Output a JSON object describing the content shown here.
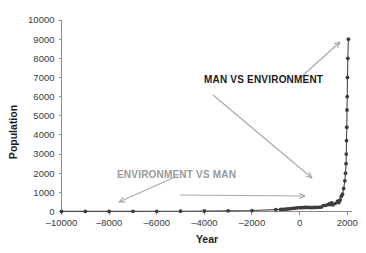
{
  "chart_data": {
    "type": "line",
    "title": "",
    "xlabel": "Year",
    "ylabel": "Population",
    "xlim": [
      -10000,
      2200
    ],
    "ylim": [
      0,
      10000
    ],
    "grid": false,
    "legend": "none",
    "markers": "filled-circle",
    "x_ticks": [
      -10000,
      -8000,
      -6000,
      -4000,
      -2000,
      0,
      2000
    ],
    "x_tick_labels": [
      "–10000",
      "–8000",
      "–6000",
      "–4000",
      "–2000",
      "0",
      "2000"
    ],
    "y_ticks": [
      0,
      1000,
      2000,
      3000,
      4000,
      5000,
      6000,
      7000,
      8000,
      9000,
      10000
    ],
    "y_tick_labels": [
      "0",
      "1000",
      "2000",
      "3000",
      "4000",
      "5000",
      "6000",
      "7000",
      "8000",
      "9000",
      "10000"
    ],
    "series": [
      {
        "name": "World Population",
        "x": [
          -10000,
          -9000,
          -8000,
          -7000,
          -6000,
          -5000,
          -4000,
          -3000,
          -2000,
          -1000,
          -800,
          -700,
          -600,
          -500,
          -400,
          -300,
          -200,
          -100,
          0,
          100,
          200,
          300,
          400,
          500,
          600,
          700,
          800,
          900,
          1000,
          1100,
          1200,
          1250,
          1300,
          1340,
          1400,
          1500,
          1600,
          1650,
          1700,
          1750,
          1800,
          1850,
          1900,
          1927,
          1950,
          1960,
          1970,
          1980,
          1990,
          1999,
          2011,
          2025,
          2050
        ],
        "y": [
          4,
          5,
          5,
          7,
          10,
          15,
          25,
          35,
          50,
          100,
          110,
          115,
          120,
          130,
          145,
          160,
          175,
          190,
          200,
          202,
          210,
          215,
          210,
          205,
          208,
          215,
          220,
          226,
          310,
          320,
          360,
          400,
          360,
          443,
          350,
          425,
          545,
          470,
          600,
          790,
          900,
          1200,
          1600,
          2000,
          2500,
          3000,
          3700,
          4400,
          5300,
          6000,
          7000,
          8000,
          9000
        ],
        "units": "millions"
      }
    ],
    "annotations": [
      {
        "id": "man-vs-environment",
        "text": "MAN VS ENVIRONMENT",
        "color": "#1b1b1b",
        "style": "bold",
        "x": 204,
        "y": 83
      },
      {
        "id": "environment-vs-man",
        "text": "ENVIRONMENT VS MAN",
        "color": "#9a9a9a",
        "style": "bold",
        "x": 117,
        "y": 178
      }
    ],
    "arrows": [
      {
        "id": "arrow-up-right",
        "from": [
          300,
          78
        ],
        "to": [
          340,
          42
        ],
        "color": "#a6a6a6"
      },
      {
        "id": "arrow-down-right",
        "from": [
          213,
          95
        ],
        "to": [
          312,
          178
        ],
        "color": "#a6a6a6"
      },
      {
        "id": "arrow-left-down",
        "from": [
          175,
          177
        ],
        "to": [
          119,
          202
        ],
        "color": "#a6a6a6"
      },
      {
        "id": "arrow-right-flat",
        "from": [
          180,
          195
        ],
        "to": [
          305,
          196
        ],
        "color": "#a6a6a6"
      }
    ],
    "colors": {
      "marker": "#3d3d3d",
      "line": "#4a4a4a",
      "axis": "#8c8c8c",
      "tick_text": "#3a3a3a",
      "background": "#ffffff"
    }
  }
}
